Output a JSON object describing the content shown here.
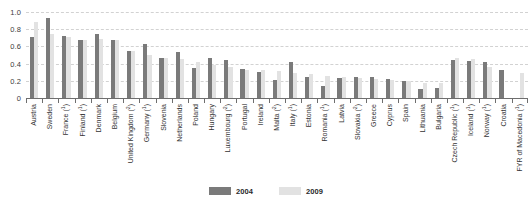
{
  "chart_data": {
    "type": "bar",
    "title": "",
    "subtitle": "",
    "xlabel": "",
    "ylabel": "",
    "ylim": [
      0,
      1.0
    ],
    "ytick_labels": [
      "1.0",
      "0.8",
      "0.6",
      "0.4",
      "0.2",
      "0"
    ],
    "ytick_values": [
      1.0,
      0.8,
      0.6,
      0.4,
      0.2,
      0
    ],
    "grid": true,
    "grid_style": "dashed-horizontal",
    "legend_position": "bottom-center",
    "legend": [
      "2004",
      "2009"
    ],
    "colors": {
      "series_2004": "#7a7a7a",
      "series_2009": "#e2e2e2",
      "gridline": "#d2d2d2",
      "axis": "#6e6e6e",
      "background": "#ffffff",
      "text": "#333333"
    },
    "categories": [
      "Austria",
      "Sweden",
      "France",
      "Finland",
      "Denmark",
      "Belgium",
      "United Kingdom",
      "Germany",
      "Slovenia",
      "Netherlands",
      "Poland",
      "Hungary",
      "Luxembourg",
      "Portugal",
      "Ireland",
      "Malta",
      "Italy",
      "Estonia",
      "Romania",
      "Latvia",
      "Slovakia",
      "Greece",
      "Cyprus",
      "Spain",
      "Lithuania",
      "Bulgaria",
      "Czech Republic",
      "Iceland",
      "Norway",
      "Croatia",
      "FYR of Macedonia"
    ],
    "category_footnotes": [
      "",
      "",
      "1",
      "1",
      "",
      "",
      "2",
      "1",
      "",
      "",
      "",
      "",
      "2",
      "",
      "",
      "2",
      "1",
      "",
      "1",
      "",
      "2",
      "",
      "",
      "",
      "",
      "",
      "1",
      "1",
      "1",
      "",
      "1"
    ],
    "series": [
      {
        "name": "2004",
        "color": "#7a7a7a",
        "values": [
          0.71,
          0.93,
          0.72,
          0.67,
          0.75,
          0.68,
          0.55,
          0.63,
          0.47,
          0.54,
          0.35,
          0.46,
          0.44,
          0.34,
          0.3,
          0.21,
          0.42,
          0.25,
          0.14,
          0.23,
          0.25,
          0.24,
          0.22,
          0.2,
          0.1,
          0.12,
          0.44,
          0.43,
          0.42,
          0.33,
          0.0
        ]
      },
      {
        "name": "2009",
        "color": "#e2e2e2",
        "values": [
          0.88,
          0.75,
          0.71,
          0.68,
          0.69,
          0.67,
          0.55,
          0.5,
          0.47,
          0.45,
          0.42,
          0.38,
          0.36,
          0.33,
          0.32,
          0.31,
          0.29,
          0.28,
          0.26,
          0.24,
          0.23,
          0.22,
          0.21,
          0.2,
          0.18,
          0.18,
          0.46,
          0.45,
          0.36,
          0.0,
          0.29
        ]
      }
    ]
  },
  "legend": {
    "entries": [
      {
        "label": "2004",
        "color": "#7a7a7a"
      },
      {
        "label": "2009",
        "color": "#e2e2e2"
      }
    ]
  }
}
